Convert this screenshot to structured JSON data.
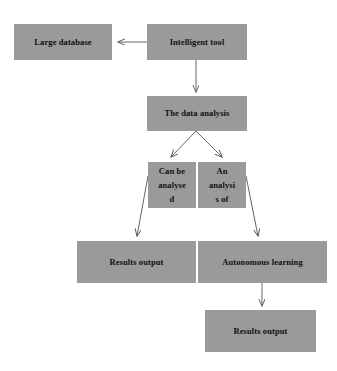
{
  "diagram": {
    "type": "flowchart",
    "canvas": {
      "width": 337,
      "height": 371
    },
    "style": {
      "node_fill": "#9a9a9a",
      "node_text": "#111111",
      "edge_color": "#555555",
      "background": "#ffffff"
    },
    "nodes": [
      {
        "id": "large-database",
        "label": "Large database"
      },
      {
        "id": "intelligent-tool",
        "label": "Intelligent tool"
      },
      {
        "id": "data-analysis",
        "label": "The data analysis"
      },
      {
        "id": "can-be-analysed",
        "label": "Can be\nanalyse\nd"
      },
      {
        "id": "an-analysis-of",
        "label": "An\nanalysi\ns of"
      },
      {
        "id": "results-output-1",
        "label": "Results output"
      },
      {
        "id": "autonomous-learning",
        "label": "Autonomous learning"
      },
      {
        "id": "results-output-2",
        "label": "Results output"
      }
    ],
    "edges": [
      {
        "id": "edge-tool-to-database",
        "from": "intelligent-tool",
        "to": "large-database",
        "direction": "left"
      },
      {
        "id": "edge-tool-to-analysis",
        "from": "intelligent-tool",
        "to": "data-analysis",
        "direction": "down"
      },
      {
        "id": "edge-analysis-to-canbe",
        "from": "data-analysis",
        "to": "can-be-analysed",
        "direction": "down-left"
      },
      {
        "id": "edge-analysis-to-anof",
        "from": "data-analysis",
        "to": "an-analysis-of",
        "direction": "down-right"
      },
      {
        "id": "edge-canbe-to-results",
        "from": "can-be-analysed",
        "to": "results-output-1",
        "direction": "down-left"
      },
      {
        "id": "edge-anof-to-autonomous",
        "from": "an-analysis-of",
        "to": "autonomous-learning",
        "direction": "down-right"
      },
      {
        "id": "edge-autonomous-to-results",
        "from": "autonomous-learning",
        "to": "results-output-2",
        "direction": "down"
      }
    ]
  }
}
